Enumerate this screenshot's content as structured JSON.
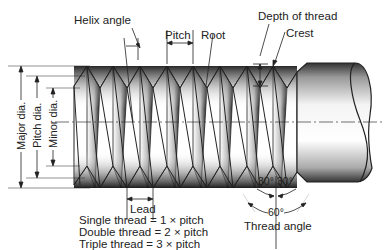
{
  "diagram": {
    "labels": {
      "helix_angle": "Helix angle",
      "pitch": "Pitch",
      "root": "Root",
      "depth_of_thread": "Depth of thread",
      "crest": "Crest",
      "major_dia": "Major dia.",
      "pitch_dia": "Pitch dia.",
      "minor_dia": "Minor dia.",
      "lead": "Lead",
      "angle_left": "30°",
      "angle_right": "30°",
      "angle_total": "60°",
      "thread_angle": "Thread angle"
    },
    "formulas": [
      "Single thread = 1 × pitch",
      "Double thread = 2 × pitch",
      "Triple thread = 3 × pitch"
    ],
    "colors": {
      "line": "#222222",
      "shade_dark": "#111111",
      "background": "#ffffff"
    }
  }
}
